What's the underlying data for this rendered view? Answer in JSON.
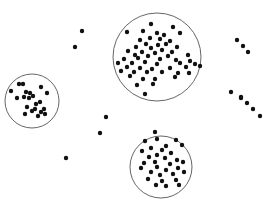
{
  "figure": {
    "colors": {
      "point": "#111111",
      "circle": "#666666",
      "background": "#ffffff"
    },
    "point_radius": 2.2
  },
  "clusters": [
    {
      "name": "cluster-large-top",
      "circle": {
        "cx": 157,
        "cy": 57,
        "r": 44
      },
      "points": [
        [
          151,
          24
        ],
        [
          173,
          27
        ],
        [
          143,
          31
        ],
        [
          180,
          33
        ],
        [
          157,
          33
        ],
        [
          164,
          35
        ],
        [
          127,
          32
        ],
        [
          150,
          38
        ],
        [
          160,
          39
        ],
        [
          140,
          40
        ],
        [
          170,
          41
        ],
        [
          146,
          44
        ],
        [
          158,
          45
        ],
        [
          166,
          44
        ],
        [
          136,
          47
        ],
        [
          177,
          47
        ],
        [
          151,
          48
        ],
        [
          162,
          50
        ],
        [
          128,
          51
        ],
        [
          142,
          52
        ],
        [
          172,
          52
        ],
        [
          155,
          53
        ],
        [
          135,
          55
        ],
        [
          148,
          56
        ],
        [
          168,
          56
        ],
        [
          188,
          55
        ],
        [
          124,
          59
        ],
        [
          138,
          58
        ],
        [
          160,
          59
        ],
        [
          176,
          60
        ],
        [
          190,
          61
        ],
        [
          118,
          63
        ],
        [
          132,
          63
        ],
        [
          145,
          62
        ],
        [
          157,
          64
        ],
        [
          180,
          63
        ],
        [
          195,
          64
        ],
        [
          127,
          67
        ],
        [
          140,
          68
        ],
        [
          152,
          69
        ],
        [
          170,
          68
        ],
        [
          186,
          67
        ],
        [
          200,
          66
        ],
        [
          121,
          71
        ],
        [
          134,
          72
        ],
        [
          147,
          72
        ],
        [
          162,
          72
        ],
        [
          178,
          73
        ],
        [
          189,
          73
        ],
        [
          130,
          76
        ],
        [
          143,
          79
        ],
        [
          155,
          79
        ],
        [
          175,
          77
        ],
        [
          137,
          85
        ],
        [
          153,
          84
        ],
        [
          145,
          94
        ]
      ]
    },
    {
      "name": "cluster-left",
      "circle": {
        "cx": 32,
        "cy": 101,
        "r": 27
      },
      "points": [
        [
          19,
          84
        ],
        [
          23,
          84
        ],
        [
          41,
          87
        ],
        [
          11,
          91
        ],
        [
          26,
          92
        ],
        [
          30,
          93
        ],
        [
          47,
          93
        ],
        [
          17,
          98
        ],
        [
          24,
          97
        ],
        [
          29,
          98
        ],
        [
          33,
          96
        ],
        [
          40,
          102
        ],
        [
          36,
          104
        ],
        [
          27,
          107
        ],
        [
          35,
          109
        ],
        [
          44,
          109
        ],
        [
          32,
          111
        ],
        [
          41,
          112
        ],
        [
          25,
          114
        ],
        [
          38,
          116
        ],
        [
          45,
          114
        ]
      ]
    },
    {
      "name": "cluster-bottom",
      "circle": {
        "cx": 161,
        "cy": 167,
        "r": 31
      },
      "points": [
        [
          155,
          132
        ],
        [
          145,
          141
        ],
        [
          157,
          139
        ],
        [
          176,
          140
        ],
        [
          182,
          145
        ],
        [
          151,
          148
        ],
        [
          162,
          150
        ],
        [
          166,
          146
        ],
        [
          142,
          151
        ],
        [
          157,
          155
        ],
        [
          171,
          153
        ],
        [
          149,
          157
        ],
        [
          165,
          158
        ],
        [
          177,
          160
        ],
        [
          144,
          163
        ],
        [
          155,
          162
        ],
        [
          170,
          164
        ],
        [
          183,
          162
        ],
        [
          141,
          168
        ],
        [
          157,
          167
        ],
        [
          166,
          170
        ],
        [
          178,
          168
        ],
        [
          151,
          172
        ],
        [
          160,
          175
        ],
        [
          173,
          174
        ],
        [
          184,
          172
        ],
        [
          148,
          179
        ],
        [
          162,
          181
        ],
        [
          176,
          180
        ],
        [
          156,
          185
        ],
        [
          166,
          186
        ],
        [
          179,
          185
        ]
      ]
    }
  ],
  "outliers": [
    [
      82,
      31
    ],
    [
      75,
      47
    ],
    [
      106,
      117
    ],
    [
      100,
      133
    ],
    [
      66,
      158
    ],
    [
      237,
      40
    ],
    [
      243,
      46
    ],
    [
      248,
      52
    ],
    [
      241,
      98
    ],
    [
      247,
      103
    ],
    [
      253,
      109
    ],
    [
      260,
      116
    ],
    [
      241,
      97
    ],
    [
      231,
      92
    ]
  ]
}
